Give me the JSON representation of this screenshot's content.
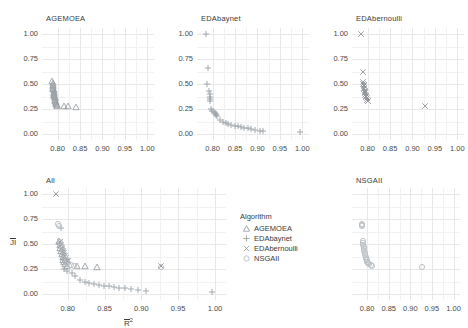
{
  "figure": {
    "axis_x_label": "R",
    "axis_x_sup": "2",
    "axis_y_label": "JI",
    "background": "#ffffff",
    "grid_color": "#e8e8e8"
  },
  "legend": {
    "title": "Algorithm",
    "items": [
      {
        "label": "AGEMOEA",
        "marker": "triangle-up-icon",
        "color": "#9aa0a6"
      },
      {
        "label": "EDAbaynet",
        "marker": "plus-icon",
        "color": "#9aa0a6"
      },
      {
        "label": "EDAbernoulli",
        "marker": "cross-icon",
        "color": "#9aa0a6"
      },
      {
        "label": "NSGAII",
        "marker": "circle-icon",
        "color": "#b9bec4"
      }
    ]
  },
  "panels": [
    {
      "id": "agemoea",
      "title": "AGEMOEA"
    },
    {
      "id": "edabaynet",
      "title": "EDAbaynet"
    },
    {
      "id": "edabernoulli",
      "title": "EDAbernoulli"
    },
    {
      "id": "all",
      "title": "All"
    },
    {
      "id": "nsgaii",
      "title": "NSGAII"
    }
  ],
  "axes": {
    "x_ticks": [
      "0.80",
      "0.85",
      "0.90",
      "0.95",
      "1.00"
    ],
    "x_tick_values": [
      0.8,
      0.85,
      0.9,
      0.95,
      1.0
    ],
    "y_ticks": [
      "0.00",
      "0.25",
      "0.50",
      "0.75",
      "1.00"
    ],
    "y_tick_values": [
      0.0,
      0.25,
      0.5,
      0.75,
      1.0
    ],
    "xlim": [
      0.765,
      1.015
    ],
    "ylim": [
      -0.06,
      1.06
    ]
  },
  "chart_data": {
    "type": "scatter",
    "title": "",
    "xlabel": "R² (mean)",
    "ylabel": "JI (mean)",
    "xlim": [
      0.765,
      1.015
    ],
    "ylim": [
      -0.06,
      1.06
    ],
    "grid": true,
    "legend_position": "center-bottom-middle-panel",
    "facets": [
      {
        "name": "AGEMOEA",
        "series": [
          {
            "name": "AGEMOEA",
            "marker": "triangle",
            "color": "#9aa0a6",
            "points": [
              [
                0.788,
                0.535
              ],
              [
                0.7885,
                0.508
              ],
              [
                0.789,
                0.495
              ],
              [
                0.7895,
                0.478
              ],
              [
                0.79,
                0.462
              ],
              [
                0.7905,
                0.45
              ],
              [
                0.7908,
                0.438
              ],
              [
                0.7912,
                0.424
              ],
              [
                0.7916,
                0.412
              ],
              [
                0.792,
                0.4
              ],
              [
                0.7924,
                0.389
              ],
              [
                0.7928,
                0.378
              ],
              [
                0.7932,
                0.367
              ],
              [
                0.7936,
                0.356
              ],
              [
                0.794,
                0.345
              ],
              [
                0.7946,
                0.334
              ],
              [
                0.7952,
                0.323
              ],
              [
                0.7958,
                0.312
              ],
              [
                0.7966,
                0.301
              ],
              [
                0.7978,
                0.29
              ],
              [
                0.7992,
                0.283
              ],
              [
                0.813,
                0.276
              ],
              [
                0.823,
                0.276
              ],
              [
                0.84,
                0.274
              ]
            ]
          }
        ]
      },
      {
        "name": "EDAbaynet",
        "series": [
          {
            "name": "EDAbaynet",
            "marker": "plus",
            "color": "#9aa0a6",
            "points": [
              [
                0.786,
                1.0
              ],
              [
                0.7905,
                0.66
              ],
              [
                0.788,
                0.5
              ],
              [
                0.792,
                0.435
              ],
              [
                0.794,
                0.4
              ],
              [
                0.7935,
                0.37
              ],
              [
                0.7938,
                0.352
              ],
              [
                0.7942,
                0.335
              ],
              [
                0.7955,
                0.25
              ],
              [
                0.799,
                0.23
              ],
              [
                0.803,
                0.218
              ],
              [
                0.8055,
                0.208
              ],
              [
                0.807,
                0.2
              ],
              [
                0.8085,
                0.19
              ],
              [
                0.81,
                0.18
              ],
              [
                0.816,
                0.145
              ],
              [
                0.823,
                0.125
              ],
              [
                0.829,
                0.11
              ],
              [
                0.835,
                0.1
              ],
              [
                0.842,
                0.092
              ],
              [
                0.849,
                0.085
              ],
              [
                0.856,
                0.078
              ],
              [
                0.863,
                0.07
              ],
              [
                0.87,
                0.063
              ],
              [
                0.878,
                0.056
              ],
              [
                0.886,
                0.048
              ],
              [
                0.895,
                0.04
              ],
              [
                0.906,
                0.032
              ],
              [
                0.912,
                0.028
              ],
              [
                0.996,
                0.02
              ]
            ]
          }
        ]
      },
      {
        "name": "EDAbernoulli",
        "series": [
          {
            "name": "EDAbernoulli",
            "marker": "cross",
            "color": "#8e9296",
            "points": [
              [
                0.784,
                1.0
              ],
              [
                0.7905,
                0.62
              ],
              [
                0.789,
                0.52
              ],
              [
                0.79,
                0.505
              ],
              [
                0.7908,
                0.49
              ],
              [
                0.7914,
                0.476
              ],
              [
                0.792,
                0.462
              ],
              [
                0.7926,
                0.448
              ],
              [
                0.7932,
                0.434
              ],
              [
                0.7938,
                0.42
              ],
              [
                0.7944,
                0.406
              ],
              [
                0.795,
                0.392
              ],
              [
                0.7958,
                0.38
              ],
              [
                0.7966,
                0.368
              ],
              [
                0.7974,
                0.356
              ],
              [
                0.7984,
                0.344
              ],
              [
                0.7996,
                0.334
              ],
              [
                0.801,
                0.328
              ],
              [
                0.927,
                0.28
              ]
            ]
          }
        ]
      },
      {
        "name": "All",
        "series": [
          {
            "name": "AGEMOEA",
            "marker": "triangle",
            "color": "#9aa0a6",
            "points": [
              [
                0.788,
                0.535
              ],
              [
                0.789,
                0.495
              ],
              [
                0.79,
                0.462
              ],
              [
                0.791,
                0.43
              ],
              [
                0.792,
                0.4
              ],
              [
                0.793,
                0.37
              ],
              [
                0.794,
                0.345
              ],
              [
                0.7952,
                0.323
              ],
              [
                0.7966,
                0.301
              ],
              [
                0.7992,
                0.283
              ],
              [
                0.813,
                0.276
              ],
              [
                0.823,
                0.276
              ],
              [
                0.84,
                0.274
              ]
            ]
          },
          {
            "name": "EDAbaynet",
            "marker": "plus",
            "color": "#9aa0a6",
            "points": [
              [
                0.7905,
                0.66
              ],
              [
                0.788,
                0.5
              ],
              [
                0.792,
                0.435
              ],
              [
                0.794,
                0.4
              ],
              [
                0.7938,
                0.352
              ],
              [
                0.7955,
                0.25
              ],
              [
                0.799,
                0.23
              ],
              [
                0.8055,
                0.208
              ],
              [
                0.81,
                0.18
              ],
              [
                0.816,
                0.145
              ],
              [
                0.823,
                0.125
              ],
              [
                0.829,
                0.11
              ],
              [
                0.835,
                0.1
              ],
              [
                0.842,
                0.092
              ],
              [
                0.849,
                0.085
              ],
              [
                0.856,
                0.078
              ],
              [
                0.863,
                0.07
              ],
              [
                0.87,
                0.063
              ],
              [
                0.878,
                0.056
              ],
              [
                0.886,
                0.048
              ],
              [
                0.895,
                0.04
              ],
              [
                0.906,
                0.032
              ],
              [
                0.996,
                0.02
              ]
            ]
          },
          {
            "name": "EDAbernoulli",
            "marker": "cross",
            "color": "#8e9296",
            "points": [
              [
                0.784,
                1.0
              ],
              [
                0.789,
                0.52
              ],
              [
                0.7908,
                0.49
              ],
              [
                0.792,
                0.462
              ],
              [
                0.7932,
                0.434
              ],
              [
                0.7944,
                0.406
              ],
              [
                0.7958,
                0.38
              ],
              [
                0.7974,
                0.356
              ],
              [
                0.7996,
                0.334
              ],
              [
                0.801,
                0.328
              ],
              [
                0.927,
                0.28
              ]
            ]
          },
          {
            "name": "NSGAII",
            "marker": "circle",
            "color": "#b9bec4",
            "points": [
              [
                0.787,
                0.7
              ],
              [
                0.7878,
                0.682
              ],
              [
                0.79,
                0.52
              ],
              [
                0.7912,
                0.49
              ],
              [
                0.7924,
                0.46
              ],
              [
                0.7936,
                0.43
              ],
              [
                0.795,
                0.4
              ],
              [
                0.7966,
                0.37
              ],
              [
                0.7984,
                0.34
              ],
              [
                0.8006,
                0.315
              ],
              [
                0.804,
                0.295
              ],
              [
                0.809,
                0.282
              ],
              [
                0.927,
                0.272
              ]
            ]
          }
        ]
      },
      {
        "name": "NSGAII",
        "series": [
          {
            "name": "NSGAII",
            "marker": "circle",
            "color": "#b9bec4",
            "points": [
              [
                0.787,
                0.7
              ],
              [
                0.7874,
                0.69
              ],
              [
                0.7878,
                0.682
              ],
              [
                0.7895,
                0.535
              ],
              [
                0.7902,
                0.515
              ],
              [
                0.791,
                0.495
              ],
              [
                0.7918,
                0.475
              ],
              [
                0.7926,
                0.455
              ],
              [
                0.7934,
                0.435
              ],
              [
                0.7944,
                0.415
              ],
              [
                0.7954,
                0.395
              ],
              [
                0.7964,
                0.375
              ],
              [
                0.7976,
                0.355
              ],
              [
                0.799,
                0.338
              ],
              [
                0.8006,
                0.322
              ],
              [
                0.8026,
                0.308
              ],
              [
                0.805,
                0.296
              ],
              [
                0.8085,
                0.288
              ],
              [
                0.812,
                0.284
              ],
              [
                0.927,
                0.272
              ]
            ]
          }
        ]
      }
    ]
  }
}
